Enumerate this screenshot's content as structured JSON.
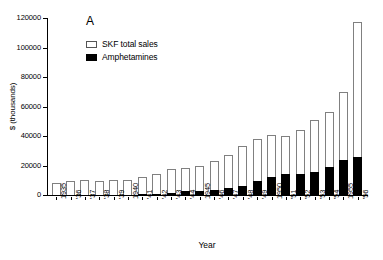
{
  "chart_data": {
    "type": "bar",
    "subtype": "stacked-vertical",
    "title": "",
    "panel_label": "A",
    "xlabel": "Year",
    "ylabel": "$ (thousands)",
    "ylim": [
      0,
      120000
    ],
    "yticks": [
      0,
      20000,
      40000,
      60000,
      80000,
      100000,
      120000
    ],
    "ytick_labels": [
      "0",
      "20000",
      "40000",
      "60000",
      "80000",
      "100000",
      "120000"
    ],
    "grid": false,
    "legend_position": "top-left",
    "categories": [
      "1935",
      "'36",
      "'37",
      "'38",
      "'39",
      "1940",
      "'41",
      "'42",
      "'43",
      "'44",
      "1945",
      "'46",
      "'47",
      "'48",
      "'49",
      "1950",
      "'51",
      "'52",
      "'53",
      "'54",
      "1955",
      "'56"
    ],
    "series": [
      {
        "name": "SKF total sales",
        "color": "#ffffff",
        "edge_color": "#808080",
        "values": [
          8000,
          9500,
          10500,
          9500,
          10500,
          10500,
          12000,
          14000,
          17500,
          18000,
          20000,
          23000,
          27000,
          33000,
          38000,
          41000,
          40000,
          44000,
          51000,
          56000,
          70000,
          117000
        ]
      },
      {
        "name": "Amphetamines",
        "color": "#000000",
        "values": [
          0,
          100,
          150,
          150,
          200,
          250,
          400,
          700,
          1200,
          2500,
          2700,
          3200,
          4500,
          6000,
          9500,
          12000,
          14000,
          14000,
          15500,
          19000,
          23500,
          26000
        ]
      }
    ],
    "note_extra_bar": {
      "category": "'56",
      "total": 130000,
      "amphetamines": 15500
    }
  },
  "axes": {
    "y_title": "$ (thousands)",
    "x_title": "Year"
  },
  "legend": {
    "entries": [
      {
        "label": "SKF total sales",
        "swatch": "open-square"
      },
      {
        "label": "Amphetamines",
        "swatch": "filled-square"
      }
    ]
  },
  "panel": {
    "label": "A"
  }
}
